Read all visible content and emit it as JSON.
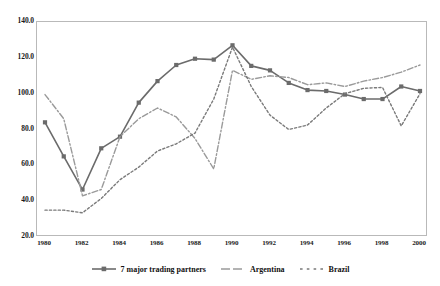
{
  "top_strip_text": "",
  "chart_data": {
    "type": "line",
    "title": "",
    "subtitle": "",
    "xlabel": "",
    "ylabel": "",
    "xlim": [
      1980,
      2000
    ],
    "ylim": [
      20.0,
      140.0
    ],
    "ytick_labels": [
      "140.0",
      "120.0",
      "100.0",
      "80.0",
      "60.0",
      "40.0",
      "20.0"
    ],
    "ytick_values": [
      140.0,
      120.0,
      100.0,
      80.0,
      60.0,
      40.0,
      20.0
    ],
    "xtick_labels": [
      "1980",
      "1982",
      "1984",
      "1986",
      "1988",
      "1990",
      "1992",
      "1994",
      "1996",
      "1998",
      "2000"
    ],
    "xtick_values": [
      1980,
      1982,
      1984,
      1986,
      1988,
      1990,
      1992,
      1994,
      1996,
      1998,
      2000
    ],
    "grid": false,
    "legend_position": "bottom",
    "x": [
      1980,
      1981,
      1982,
      1983,
      1984,
      1985,
      1986,
      1987,
      1988,
      1989,
      1990,
      1991,
      1992,
      1993,
      1994,
      1995,
      1996,
      1997,
      1998,
      1999,
      2000
    ],
    "series": [
      {
        "name": "7 major trading partners",
        "style": "solid",
        "marker": "square",
        "color": "#6b6b6b",
        "values": [
          84.0,
          65.0,
          46.5,
          69.5,
          76.0,
          95.0,
          107.0,
          116.0,
          119.5,
          119.0,
          127.0,
          115.5,
          113.0,
          106.0,
          102.0,
          101.5,
          99.5,
          97.0,
          97.0,
          104.0,
          101.5
        ]
      },
      {
        "name": "Argentina",
        "style": "dash-dot",
        "marker": "none",
        "color": "#9a9a9a",
        "values": [
          99.5,
          86.0,
          43.0,
          46.5,
          76.0,
          86.0,
          92.0,
          87.0,
          75.0,
          58.0,
          113.0,
          108.0,
          110.0,
          109.0,
          105.0,
          106.0,
          104.0,
          107.0,
          109.0,
          112.0,
          116.0
        ]
      },
      {
        "name": "Brazil",
        "style": "dotted",
        "marker": "none",
        "color": "#7a7a7a",
        "values": [
          35.0,
          35.0,
          33.5,
          41.5,
          52.0,
          59.0,
          68.0,
          72.0,
          78.0,
          97.0,
          126.0,
          104.0,
          88.0,
          80.0,
          82.5,
          92.0,
          100.0,
          103.0,
          103.5,
          82.0,
          100.0
        ]
      }
    ]
  },
  "legend": {
    "items": [
      {
        "label": "7 major trading partners"
      },
      {
        "label": "Argentina"
      },
      {
        "label": "Brazil"
      }
    ]
  }
}
